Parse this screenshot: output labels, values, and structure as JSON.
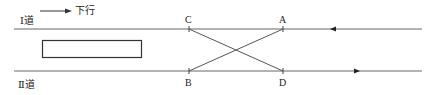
{
  "legend": {
    "direction_label": "下行",
    "arrow": "right-arrow"
  },
  "tracks": [
    {
      "id": "track-1",
      "label": "Ⅰ道",
      "y": 29,
      "arrow_direction": "left"
    },
    {
      "id": "track-2",
      "label": "Ⅱ道",
      "y": 71,
      "arrow_direction": "right"
    }
  ],
  "points": [
    {
      "name": "C",
      "x": 189,
      "track": "track-1"
    },
    {
      "name": "A",
      "x": 283,
      "track": "track-1"
    },
    {
      "name": "B",
      "x": 189,
      "track": "track-2"
    },
    {
      "name": "D",
      "x": 283,
      "track": "track-2"
    }
  ],
  "crossovers": [
    {
      "from": "C",
      "to": "D"
    },
    {
      "from": "B",
      "to": "A"
    }
  ],
  "platform": {
    "shape": "rectangle"
  },
  "colors": {
    "line": "#555555",
    "text": "#222222"
  }
}
